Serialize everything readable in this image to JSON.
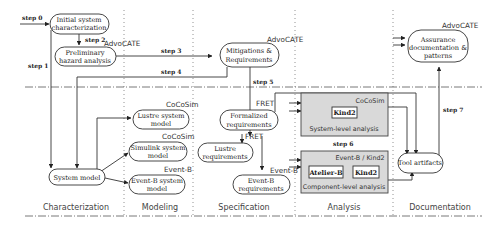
{
  "columns": [
    "Characterization",
    "Modeling",
    "Specification",
    "Analysis",
    "Documentation"
  ],
  "nodes": {
    "initial": {
      "line1": "Initial system",
      "line2": "characterization"
    },
    "pha": {
      "line1": "Preliminary",
      "line2": "hazard analysis",
      "tool": "AdvoCATE"
    },
    "mitigations": {
      "line1": "Mitigations &",
      "line2": "Requirements",
      "tool": "AdvoCATE"
    },
    "assurance": {
      "line1": "Assurance",
      "line2": "documentation &",
      "line3": "patterns",
      "tool": "AdvoCATE"
    },
    "system_model": {
      "line1": "System model"
    },
    "lustre_model": {
      "line1": "Lustre system",
      "line2": "model",
      "tool": "CoCoSim"
    },
    "simulink_model": {
      "line1": "Simulink system",
      "line2": "model",
      "tool": "CoCoSim"
    },
    "eventb_model": {
      "line1": "Event-B system",
      "line2": "model",
      "tool": "Event-B"
    },
    "formalized": {
      "line1": "Formalized",
      "line2": "requirements",
      "tool": "FRET"
    },
    "lustre_req": {
      "line1": "Lustre",
      "line2": "requirements",
      "tool": "FRET"
    },
    "eventb_req": {
      "line1": "Event-B",
      "line2": "requirements",
      "tool": "Event-B"
    },
    "tool_artifacts": {
      "line1": "Tool artifacts"
    }
  },
  "panels": {
    "system_level": {
      "tool": "CoCoSim",
      "inner": [
        "Kind2"
      ],
      "caption": "System-level analysis"
    },
    "component_level": {
      "tool": "Event-B / Kind2",
      "inner": [
        "Atelier-B",
        "Kind2"
      ],
      "caption": "Component-level analysis"
    }
  },
  "steps": [
    "step 0",
    "step 1",
    "step 2",
    "step 3",
    "step 4",
    "step 5",
    "step 6",
    "step 7"
  ]
}
